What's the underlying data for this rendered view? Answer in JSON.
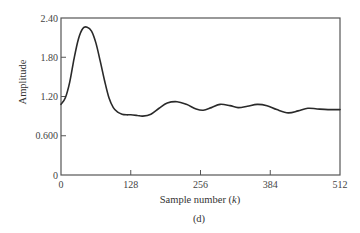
{
  "chart_data": {
    "type": "line",
    "title": "",
    "caption": "(d)",
    "xlabel": "Sample number",
    "xlabel_var": "k",
    "ylabel": "Amplitude",
    "xlim": [
      0,
      512
    ],
    "ylim": [
      0,
      2.4
    ],
    "xticks": [
      0,
      128,
      256,
      384,
      512
    ],
    "xtick_labels": [
      "0",
      "128",
      "256",
      "384",
      "512"
    ],
    "yticks": [
      0,
      0.6,
      1.2,
      1.8,
      2.4
    ],
    "ytick_labels": [
      "0",
      "0.600",
      "1.20",
      "1.80",
      "2.40"
    ],
    "grid": false,
    "legend": null,
    "series": [
      {
        "name": "amplitude",
        "color": "#2a2a2a",
        "x": [
          0,
          8,
          16,
          24,
          32,
          40,
          48,
          56,
          64,
          72,
          80,
          88,
          96,
          104,
          112,
          120,
          128,
          140,
          150,
          165,
          180,
          195,
          213,
          230,
          248,
          261,
          276,
          292,
          310,
          325,
          342,
          360,
          378,
          396,
          417,
          435,
          453,
          470,
          490,
          512
        ],
        "y": [
          1.08,
          1.18,
          1.42,
          1.78,
          2.08,
          2.24,
          2.26,
          2.2,
          2.02,
          1.74,
          1.44,
          1.18,
          1.03,
          0.96,
          0.93,
          0.92,
          0.92,
          0.91,
          0.9,
          0.93,
          1.02,
          1.1,
          1.12,
          1.08,
          1.01,
          0.99,
          1.03,
          1.08,
          1.06,
          1.03,
          1.05,
          1.08,
          1.06,
          1.0,
          0.95,
          0.98,
          1.02,
          1.01,
          1.0,
          1.0
        ]
      }
    ]
  }
}
